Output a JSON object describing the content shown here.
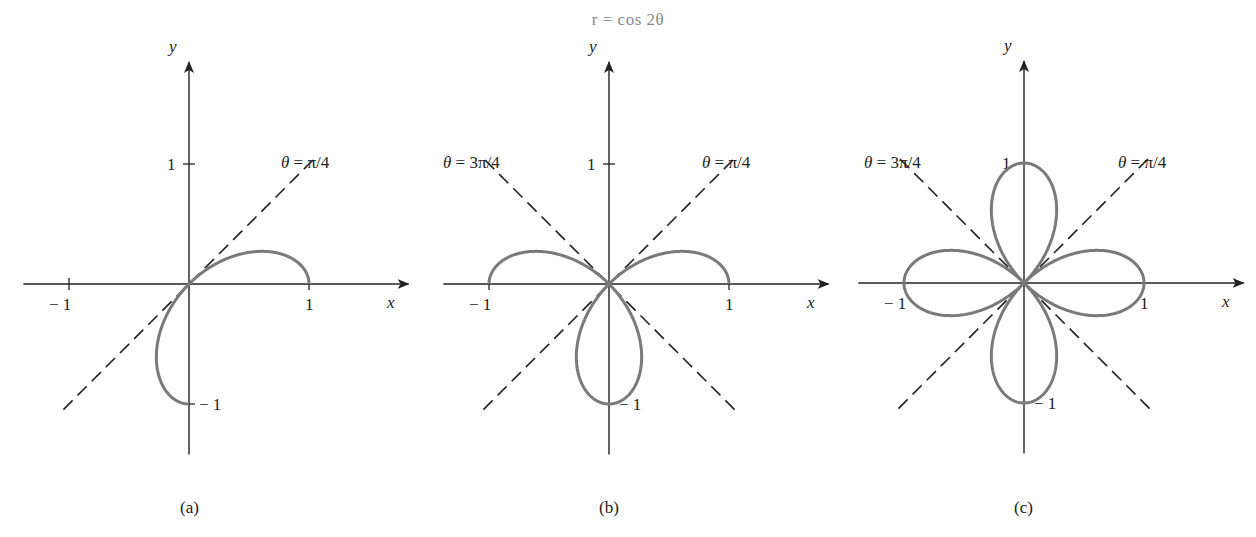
{
  "title": "r = cos 2θ",
  "colors": {
    "curve": "#7a7a7a",
    "axes": "#222222",
    "background": "#ffffff"
  },
  "panels": [
    {
      "id": "a",
      "caption": "(a)",
      "origin": [
        189,
        284
      ],
      "unit": 120,
      "theta_range": [
        0,
        1.5707963
      ],
      "lines": [
        {
          "label": "θ = π/4",
          "angle": 0.785398,
          "label_pos": [
            281,
            168
          ]
        }
      ],
      "ticks": {
        "x_pos": "1",
        "x_neg": "− 1",
        "y_pos": "1",
        "y_neg": "− 1"
      },
      "axis_labels": {
        "x": "x",
        "y": "y"
      }
    },
    {
      "id": "b",
      "caption": "(b)",
      "origin": [
        609,
        284
      ],
      "unit": 120,
      "theta_range": [
        0,
        3.1415927
      ],
      "lines": [
        {
          "label": "θ = π/4",
          "angle": 0.785398,
          "label_pos": [
            702,
            168
          ]
        },
        {
          "label": "θ = 3π/4",
          "angle": 2.356194,
          "label_pos": [
            443,
            168
          ]
        }
      ],
      "ticks": {
        "x_pos": "1",
        "x_neg": "− 1",
        "y_pos": "1",
        "y_neg": "− 1"
      },
      "axis_labels": {
        "x": "x",
        "y": "y"
      }
    },
    {
      "id": "c",
      "caption": "(c)",
      "origin": [
        1024,
        283
      ],
      "unit": 120,
      "theta_range": [
        0,
        6.2831853
      ],
      "lines": [
        {
          "label": "θ = π/4",
          "angle": 0.785398,
          "label_pos": [
            1118,
            168
          ]
        },
        {
          "label": "θ = 3π/4",
          "angle": 2.356194,
          "label_pos": [
            864,
            168
          ]
        }
      ],
      "ticks": {
        "x_pos": "1",
        "x_neg": "− 1",
        "y_pos": "1",
        "y_neg": "− 1"
      },
      "axis_labels": {
        "x": "x",
        "y": "y"
      }
    }
  ],
  "chart_data": [
    {
      "type": "line",
      "title": "r = cos 2θ, 0 ≤ θ ≤ π/2",
      "caption": "(a)",
      "equation": "r = cos(2θ)",
      "coordinate_system": "polar",
      "theta_min": 0,
      "theta_max": "π/2",
      "reference_lines": [
        "θ = π/4"
      ],
      "xlabel": "x",
      "ylabel": "y",
      "x_ticks": [
        -1,
        1
      ],
      "y_ticks": [
        -1,
        1
      ],
      "xlim": [
        -1,
        1
      ],
      "ylim": [
        -1,
        1
      ],
      "grid": false
    },
    {
      "type": "line",
      "title": "r = cos 2θ, 0 ≤ θ ≤ π",
      "caption": "(b)",
      "equation": "r = cos(2θ)",
      "coordinate_system": "polar",
      "theta_min": 0,
      "theta_max": "π",
      "reference_lines": [
        "θ = π/4",
        "θ = 3π/4"
      ],
      "xlabel": "x",
      "ylabel": "y",
      "x_ticks": [
        -1,
        1
      ],
      "y_ticks": [
        -1,
        1
      ],
      "xlim": [
        -1,
        1
      ],
      "ylim": [
        -1,
        1
      ],
      "grid": false
    },
    {
      "type": "line",
      "title": "r = cos 2θ, 0 ≤ θ ≤ 2π (four-leaved rose)",
      "caption": "(c)",
      "equation": "r = cos(2θ)",
      "coordinate_system": "polar",
      "theta_min": 0,
      "theta_max": "2π",
      "reference_lines": [
        "θ = π/4",
        "θ = 3π/4"
      ],
      "xlabel": "x",
      "ylabel": "y",
      "x_ticks": [
        -1,
        1
      ],
      "y_ticks": [
        -1,
        1
      ],
      "xlim": [
        -1,
        1
      ],
      "ylim": [
        -1,
        1
      ],
      "grid": false
    }
  ]
}
